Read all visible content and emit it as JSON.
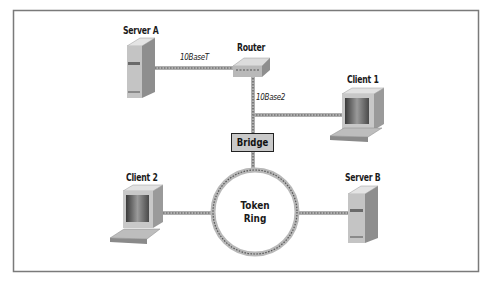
{
  "diagram": {
    "type": "network-topology",
    "nodes": [
      {
        "id": "server_a",
        "label": "Server A",
        "kind": "server"
      },
      {
        "id": "router",
        "label": "Router",
        "kind": "router"
      },
      {
        "id": "client_1",
        "label": "Client 1",
        "kind": "workstation"
      },
      {
        "id": "bridge",
        "label": "Bridge",
        "kind": "bridge"
      },
      {
        "id": "token_ring",
        "label_line1": "Token",
        "label_line2": "Ring",
        "kind": "ring-network"
      },
      {
        "id": "client_2",
        "label": "Client 2",
        "kind": "workstation"
      },
      {
        "id": "server_b",
        "label": "Server B",
        "kind": "server"
      }
    ],
    "links": [
      {
        "from": "server_a",
        "to": "router",
        "label": "10BaseT"
      },
      {
        "from": "router",
        "to": "bridge",
        "label": "10Base2"
      },
      {
        "from": "client_1",
        "to": "router-bridge-segment",
        "label": ""
      },
      {
        "from": "bridge",
        "to": "token_ring",
        "label": ""
      },
      {
        "from": "client_2",
        "to": "token_ring",
        "label": ""
      },
      {
        "from": "server_b",
        "to": "token_ring",
        "label": ""
      }
    ],
    "colors": {
      "frame": "#7a7a7a",
      "link": "#a8a8a8",
      "link_dash": "#555555",
      "device_light": "#d6d6d6",
      "device_mid": "#b5b5b5",
      "device_dark": "#8c8c8c",
      "bridge_fill": "#c9c9c9"
    }
  },
  "labels": {
    "server_a": "Server A",
    "router": "Router",
    "client_1": "Client 1",
    "bridge": "Bridge",
    "ring_line1": "Token",
    "ring_line2": "Ring",
    "client_2": "Client 2",
    "server_b": "Server B",
    "link_10baset": "10BaseT",
    "link_10base2": "10Base2"
  }
}
